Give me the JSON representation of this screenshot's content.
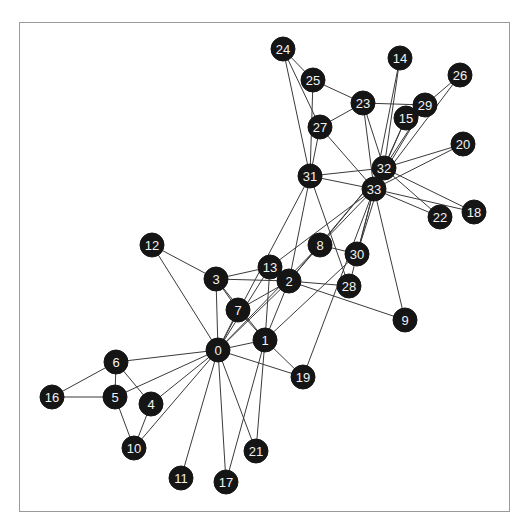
{
  "figure": {
    "title": "",
    "background_color": "#ffffff",
    "frame_color": "#9a9a9a",
    "width": 524,
    "height": 531
  },
  "chart_data": {
    "type": "scatter",
    "subtype": "network-graph",
    "title": "",
    "subtitle": "",
    "xlabel": "",
    "ylabel": "",
    "grid": false,
    "legend": false,
    "legend_position": "none",
    "axis_ticks": [],
    "node_color": "#151515",
    "node_label_color": "#f2f2f2",
    "edge_color": "#3a3a3a",
    "node_radius": 12,
    "node_count": 34,
    "edge_count": 78,
    "xlim": [
      19,
      510
    ],
    "ylim": [
      22,
      512
    ],
    "nodes": [
      {
        "id": "0",
        "label": "0",
        "x": 218,
        "y": 350
      },
      {
        "id": "1",
        "label": "1",
        "x": 265,
        "y": 340
      },
      {
        "id": "2",
        "label": "2",
        "x": 289,
        "y": 281
      },
      {
        "id": "3",
        "label": "3",
        "x": 216,
        "y": 279
      },
      {
        "id": "4",
        "label": "4",
        "x": 151,
        "y": 404
      },
      {
        "id": "5",
        "label": "5",
        "x": 115,
        "y": 397
      },
      {
        "id": "6",
        "label": "6",
        "x": 116,
        "y": 362
      },
      {
        "id": "7",
        "label": "7",
        "x": 238,
        "y": 310
      },
      {
        "id": "8",
        "label": "8",
        "x": 320,
        "y": 245
      },
      {
        "id": "9",
        "label": "9",
        "x": 405,
        "y": 320
      },
      {
        "id": "10",
        "label": "10",
        "x": 134,
        "y": 448
      },
      {
        "id": "11",
        "label": "11",
        "x": 181,
        "y": 478
      },
      {
        "id": "12",
        "label": "12",
        "x": 152,
        "y": 245
      },
      {
        "id": "13",
        "label": "13",
        "x": 270,
        "y": 267
      },
      {
        "id": "14",
        "label": "14",
        "x": 400,
        "y": 58
      },
      {
        "id": "15",
        "label": "15",
        "x": 406,
        "y": 118
      },
      {
        "id": "16",
        "label": "16",
        "x": 52,
        "y": 397
      },
      {
        "id": "17",
        "label": "17",
        "x": 226,
        "y": 482
      },
      {
        "id": "18",
        "label": "18",
        "x": 474,
        "y": 212
      },
      {
        "id": "19",
        "label": "19",
        "x": 303,
        "y": 377
      },
      {
        "id": "20",
        "label": "20",
        "x": 463,
        "y": 144
      },
      {
        "id": "21",
        "label": "21",
        "x": 256,
        "y": 451
      },
      {
        "id": "22",
        "label": "22",
        "x": 440,
        "y": 217
      },
      {
        "id": "23",
        "label": "23",
        "x": 363,
        "y": 103
      },
      {
        "id": "24",
        "label": "24",
        "x": 283,
        "y": 49
      },
      {
        "id": "25",
        "label": "25",
        "x": 313,
        "y": 80
      },
      {
        "id": "26",
        "label": "26",
        "x": 460,
        "y": 75
      },
      {
        "id": "27",
        "label": "27",
        "x": 320,
        "y": 127
      },
      {
        "id": "28",
        "label": "28",
        "x": 349,
        "y": 286
      },
      {
        "id": "29",
        "label": "29",
        "x": 425,
        "y": 105
      },
      {
        "id": "30",
        "label": "30",
        "x": 357,
        "y": 254
      },
      {
        "id": "31",
        "label": "31",
        "x": 310,
        "y": 176
      },
      {
        "id": "32",
        "label": "32",
        "x": 384,
        "y": 168
      },
      {
        "id": "33",
        "label": "33",
        "x": 374,
        "y": 189
      }
    ],
    "edges": [
      [
        "0",
        "1"
      ],
      [
        "0",
        "2"
      ],
      [
        "0",
        "3"
      ],
      [
        "0",
        "4"
      ],
      [
        "0",
        "5"
      ],
      [
        "0",
        "6"
      ],
      [
        "0",
        "7"
      ],
      [
        "0",
        "8"
      ],
      [
        "0",
        "10"
      ],
      [
        "0",
        "11"
      ],
      [
        "0",
        "12"
      ],
      [
        "0",
        "13"
      ],
      [
        "0",
        "17"
      ],
      [
        "0",
        "19"
      ],
      [
        "0",
        "21"
      ],
      [
        "0",
        "31"
      ],
      [
        "1",
        "2"
      ],
      [
        "1",
        "3"
      ],
      [
        "1",
        "7"
      ],
      [
        "1",
        "13"
      ],
      [
        "1",
        "17"
      ],
      [
        "1",
        "19"
      ],
      [
        "1",
        "21"
      ],
      [
        "1",
        "30"
      ],
      [
        "2",
        "3"
      ],
      [
        "2",
        "7"
      ],
      [
        "2",
        "8"
      ],
      [
        "2",
        "9"
      ],
      [
        "2",
        "13"
      ],
      [
        "2",
        "27"
      ],
      [
        "2",
        "28"
      ],
      [
        "2",
        "32"
      ],
      [
        "3",
        "7"
      ],
      [
        "3",
        "12"
      ],
      [
        "3",
        "13"
      ],
      [
        "4",
        "6"
      ],
      [
        "4",
        "10"
      ],
      [
        "5",
        "6"
      ],
      [
        "5",
        "10"
      ],
      [
        "5",
        "16"
      ],
      [
        "6",
        "16"
      ],
      [
        "8",
        "30"
      ],
      [
        "8",
        "32"
      ],
      [
        "8",
        "33"
      ],
      [
        "9",
        "33"
      ],
      [
        "13",
        "33"
      ],
      [
        "14",
        "32"
      ],
      [
        "14",
        "33"
      ],
      [
        "15",
        "32"
      ],
      [
        "15",
        "33"
      ],
      [
        "18",
        "32"
      ],
      [
        "18",
        "33"
      ],
      [
        "19",
        "33"
      ],
      [
        "20",
        "32"
      ],
      [
        "20",
        "33"
      ],
      [
        "22",
        "32"
      ],
      [
        "22",
        "33"
      ],
      [
        "23",
        "25"
      ],
      [
        "23",
        "27"
      ],
      [
        "23",
        "29"
      ],
      [
        "23",
        "32"
      ],
      [
        "23",
        "33"
      ],
      [
        "24",
        "25"
      ],
      [
        "24",
        "27"
      ],
      [
        "24",
        "31"
      ],
      [
        "25",
        "31"
      ],
      [
        "26",
        "29"
      ],
      [
        "26",
        "33"
      ],
      [
        "27",
        "33"
      ],
      [
        "28",
        "31"
      ],
      [
        "28",
        "33"
      ],
      [
        "29",
        "32"
      ],
      [
        "29",
        "33"
      ],
      [
        "30",
        "32"
      ],
      [
        "30",
        "33"
      ],
      [
        "31",
        "32"
      ],
      [
        "31",
        "33"
      ],
      [
        "32",
        "33"
      ]
    ]
  }
}
